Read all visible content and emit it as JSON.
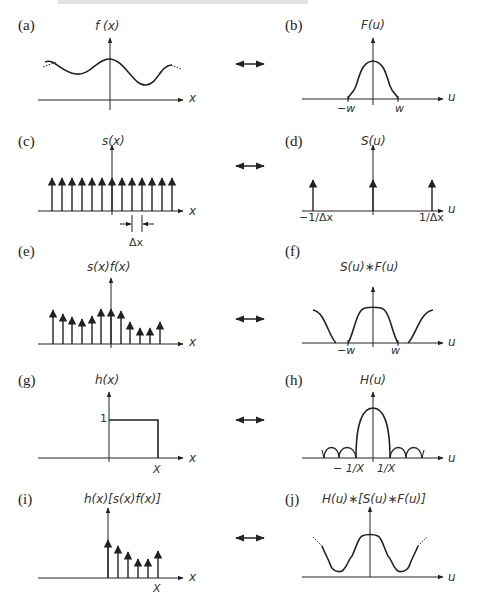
{
  "panels": [
    {
      "id": "a",
      "label": "(a)",
      "function": "f (x)",
      "axis": "x"
    },
    {
      "id": "b",
      "label": "(b)",
      "function": "F(u)",
      "axis": "u",
      "ticks": [
        "−w",
        "w"
      ]
    },
    {
      "id": "c",
      "label": "(c)",
      "function": "s(x)",
      "axis": "x",
      "spacing_label": "Δx"
    },
    {
      "id": "d",
      "label": "(d)",
      "function": "S(u)",
      "axis": "u",
      "ticks": [
        "−1/Δx",
        "1/Δx"
      ]
    },
    {
      "id": "e",
      "label": "(e)",
      "function": "s(x)f(x)",
      "axis": "x"
    },
    {
      "id": "f",
      "label": "(f)",
      "function": "S(u)∗F(u)",
      "axis": "u",
      "ticks": [
        "−w",
        "w"
      ]
    },
    {
      "id": "g",
      "label": "(g)",
      "function": "h(x)",
      "axis": "x",
      "ticks": [
        "1",
        "X"
      ]
    },
    {
      "id": "h",
      "label": "(h)",
      "function": "H(u)",
      "axis": "u",
      "ticks": [
        "− 1/X",
        "1/X"
      ]
    },
    {
      "id": "i",
      "label": "(i)",
      "function": "h(x)[s(x)f(x)]",
      "axis": "x",
      "ticks": [
        "X"
      ]
    },
    {
      "id": "j",
      "label": "(j)",
      "function": "H(u)∗[S(u)∗F(u)]",
      "axis": "u"
    }
  ],
  "transform_symbol": "⟷",
  "colors": {
    "ink": "#222222",
    "background": "#ffffff"
  }
}
